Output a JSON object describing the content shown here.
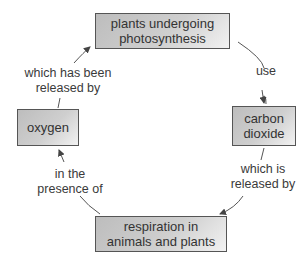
{
  "diagram": {
    "type": "cycle",
    "nodes": [
      {
        "id": "plants",
        "label_line1": "plants undergoing",
        "label_line2": "photosynthesis"
      },
      {
        "id": "co2",
        "label_line1": "carbon",
        "label_line2": "dioxide"
      },
      {
        "id": "respiration",
        "label_line1": "respiration in",
        "label_line2": "animals and plants"
      },
      {
        "id": "oxygen",
        "label_line1": "oxygen"
      }
    ],
    "edges": [
      {
        "from": "plants",
        "to": "co2",
        "label_line1": "use"
      },
      {
        "from": "co2",
        "to": "respiration",
        "label_line1": "which is",
        "label_line2": "released by"
      },
      {
        "from": "respiration",
        "to": "oxygen",
        "label_line1": "in the",
        "label_line2": "presence of"
      },
      {
        "from": "oxygen",
        "to": "plants",
        "label_line1": "which has been",
        "label_line2": "released by"
      }
    ],
    "colors": {
      "box_fill": "#c8c8c8",
      "box_border": "#555555",
      "text": "#333333",
      "arrow": "#444444"
    }
  }
}
